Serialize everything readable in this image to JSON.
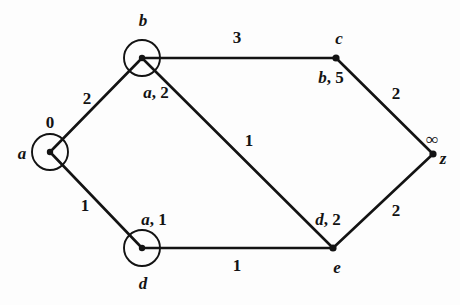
{
  "figure": {
    "type": "weighted-undirected-graph",
    "background_color": "#fdfdfd",
    "stroke_color": "#131313"
  },
  "nodes": [
    {
      "id": "a",
      "name": "a",
      "label_pos": "left",
      "shape": "circle",
      "cx": 50,
      "cy": 152,
      "r": 18,
      "label_x": 22,
      "label_y": 153,
      "annotation": "0",
      "annotation_kind": "distance",
      "annotation_x": 50,
      "annotation_y": 122
    },
    {
      "id": "b",
      "name": "b",
      "label_pos": "above",
      "shape": "circle",
      "cx": 142,
      "cy": 58,
      "r": 18,
      "label_x": 143,
      "label_y": 20,
      "annotation": "a, 2",
      "annotation_kind": "pair",
      "annotation_pred": "a",
      "annotation_dist": "2",
      "annotation_x": 156,
      "annotation_y": 92
    },
    {
      "id": "c",
      "name": "c",
      "label_pos": "above",
      "shape": "dot",
      "cx": 336,
      "cy": 58,
      "r": 4,
      "label_x": 339,
      "label_y": 38,
      "annotation": "b, 5",
      "annotation_kind": "pair",
      "annotation_pred": "b",
      "annotation_dist": "5",
      "annotation_x": 331,
      "annotation_y": 77
    },
    {
      "id": "d",
      "name": "d",
      "label_pos": "below",
      "shape": "circle",
      "cx": 142,
      "cy": 248,
      "r": 18,
      "label_x": 143,
      "label_y": 283,
      "annotation": "a, 1",
      "annotation_kind": "pair",
      "annotation_pred": "a",
      "annotation_dist": "1",
      "annotation_x": 154,
      "annotation_y": 219
    },
    {
      "id": "e",
      "name": "e",
      "label_pos": "below",
      "shape": "dot",
      "cx": 333,
      "cy": 248,
      "r": 4,
      "label_x": 337,
      "label_y": 267,
      "annotation": "d, 2",
      "annotation_kind": "pair",
      "annotation_pred": "d",
      "annotation_dist": "2",
      "annotation_x": 328,
      "annotation_y": 219
    },
    {
      "id": "z",
      "name": "z",
      "label_pos": "right",
      "shape": "dot",
      "cx": 433,
      "cy": 154,
      "r": 4,
      "label_x": 443,
      "label_y": 158,
      "annotation": "∞",
      "annotation_kind": "distance",
      "annotation_x": 432,
      "annotation_y": 139
    }
  ],
  "edges": [
    {
      "from": "a",
      "to": "b",
      "weight": "2",
      "x1": 50,
      "y1": 152,
      "x2": 142,
      "y2": 58,
      "label_x": 87,
      "label_y": 98
    },
    {
      "from": "b",
      "to": "c",
      "weight": "3",
      "x1": 142,
      "y1": 58,
      "x2": 336,
      "y2": 58,
      "label_x": 237,
      "label_y": 37
    },
    {
      "from": "c",
      "to": "z",
      "weight": "2",
      "x1": 336,
      "y1": 58,
      "x2": 433,
      "y2": 154,
      "label_x": 396,
      "label_y": 93
    },
    {
      "from": "a",
      "to": "d",
      "weight": "1",
      "x1": 50,
      "y1": 152,
      "x2": 142,
      "y2": 248,
      "label_x": 85,
      "label_y": 205
    },
    {
      "from": "d",
      "to": "e",
      "weight": "1",
      "x1": 142,
      "y1": 248,
      "x2": 333,
      "y2": 248,
      "label_x": 237,
      "label_y": 265
    },
    {
      "from": "e",
      "to": "z",
      "weight": "2",
      "x1": 333,
      "y1": 248,
      "x2": 433,
      "y2": 154,
      "label_x": 396,
      "label_y": 210
    },
    {
      "from": "b",
      "to": "e",
      "weight": "1",
      "x1": 142,
      "y1": 58,
      "x2": 333,
      "y2": 248,
      "label_x": 249,
      "label_y": 140
    }
  ]
}
